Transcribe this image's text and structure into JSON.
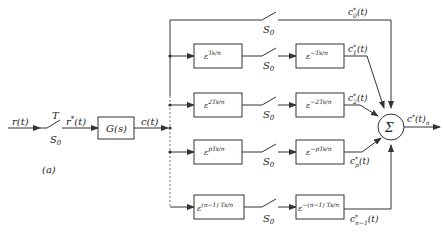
{
  "diagram": {
    "type": "block-diagram",
    "input": {
      "signal": "r(t)",
      "switch_period": "T",
      "switch_label": "S0",
      "sampled_signal": "r*(t)"
    },
    "plant": {
      "label": "G(s)",
      "output": "c(t)"
    },
    "subfigure_label": "(a)",
    "figure_caption": "",
    "branches": [
      {
        "id": "0",
        "advance": null,
        "switch": "S0",
        "delay": null,
        "output": "c*0(t)"
      },
      {
        "id": "1",
        "advance": "ε^{Ts/n}",
        "switch": "S0",
        "delay": "ε^{-Ts/n}",
        "output": "c*1(t)"
      },
      {
        "id": "2",
        "advance": "ε^{2Ts/n}",
        "switch": "S0",
        "delay": "ε^{-2Ts/n}",
        "output": "c*2(t)"
      },
      {
        "id": "p",
        "advance": "ε^{pTs/n}",
        "switch": "S0",
        "delay": "ε^{-pTs/n}",
        "output": "c*p(t)"
      },
      {
        "id": "n-1",
        "advance": "ε^{(n-1)Ts/n}",
        "switch": "S0",
        "delay": "ε^{-(n-1)Ts/n}",
        "output": "c*n-1(t)"
      }
    ],
    "summer": {
      "symbol": "Σ",
      "output": "c*(t)n"
    }
  },
  "labels": {
    "r": "r(t)",
    "T": "T",
    "S0": "S",
    "S0_sub": "0",
    "rstar_r": "r",
    "rstar_sup": "*",
    "rstar_tail": "(t)",
    "G": "G(s)",
    "c": "c(t)",
    "a": "(a)",
    "eps": "ε",
    "adv1": "Ts/n",
    "adv2": "2Ts/n",
    "advp": "pTs/n",
    "advn": "(n−1) Ts/n",
    "del1": "−Ts/n",
    "del2": "−2Ts/n",
    "delp": "−pTs/n",
    "deln": "−(n−1) Ts/n",
    "c_base": "c",
    "star": "*",
    "t_arg": "(t)",
    "sub0": "0",
    "sub1": "1",
    "sub2": "2",
    "subp": "p",
    "subn": "n−1",
    "sigma": "Σ",
    "out_sub": "n",
    "fig_mark": "Fig."
  }
}
